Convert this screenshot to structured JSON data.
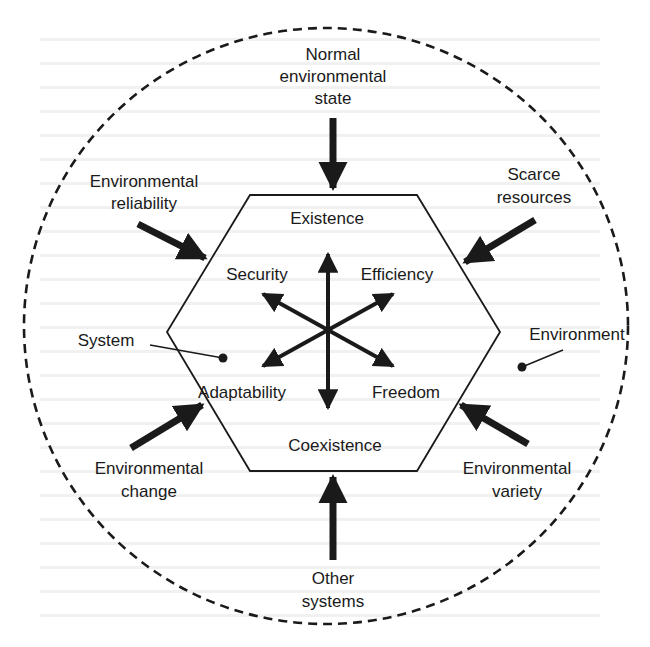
{
  "diagram": {
    "type": "system-environment-orientors",
    "colors": {
      "ink": "#1a1a1a",
      "background": "#ffffff",
      "bleed_text": "#efefef"
    },
    "boundary": {
      "label_environment": "Environment",
      "label_system": "System",
      "style": "dashed-circle"
    },
    "hexagon": {
      "top_label": "Existence",
      "bottom_label": "Coexistence"
    },
    "orientors": {
      "upper_left": "Security",
      "upper_right": "Efficiency",
      "lower_left": "Adaptability",
      "lower_right": "Freedom"
    },
    "environmental_properties": {
      "top": [
        "Normal",
        "environmental",
        "state"
      ],
      "upper_left": [
        "Environmental",
        "reliability"
      ],
      "upper_right": [
        "Scarce",
        "resources"
      ],
      "lower_left": [
        "Environmental",
        "change"
      ],
      "lower_right": [
        "Environmental",
        "variety"
      ],
      "bottom": [
        "Other",
        "systems"
      ]
    }
  }
}
